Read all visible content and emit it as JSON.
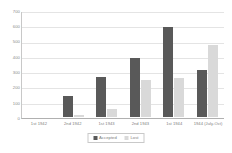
{
  "chart_data": {
    "type": "bar",
    "title": "",
    "subtitle": "",
    "xlabel": "",
    "ylabel": "",
    "ylim": [
      0,
      700
    ],
    "ytick_step": 100,
    "yticks": [
      "700",
      "600",
      "500",
      "400",
      "300",
      "200",
      "100",
      "0"
    ],
    "grid": true,
    "legend_position": "bottom",
    "categories": [
      "1st 1942",
      "2nd 1942",
      "1st 1943",
      "2nd 1943",
      "1st 1944",
      "1944 (July-Oct)"
    ],
    "series": [
      {
        "name": "Accepted",
        "color": "#595959",
        "values": [
          0,
          140,
          265,
          385,
          590,
          305
        ]
      },
      {
        "name": "Lost",
        "color": "#d9d9d9",
        "values": [
          0,
          10,
          50,
          240,
          255,
          470
        ]
      }
    ]
  },
  "legend": {
    "items": [
      {
        "label": "Accepted",
        "swatch": "accepted-swatch"
      },
      {
        "label": "Lost",
        "swatch": "lost-swatch"
      }
    ]
  },
  "colors": {
    "accepted": "#595959",
    "lost": "#d9d9d9",
    "gridline": "#e4e4e4",
    "axis": "#b0b0b0",
    "text": "#7d7d7d",
    "background": "#ffffff"
  }
}
